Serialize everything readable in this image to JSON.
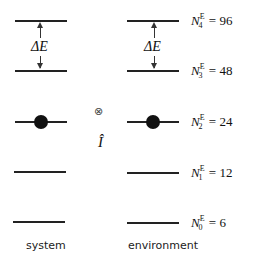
{
  "system": {
    "caption": "system",
    "delta_label": "ΔE",
    "occupied_level_index": 2
  },
  "operator": {
    "tensor_symbol": "⊗",
    "identity_symbol": "Î"
  },
  "environment": {
    "caption": "environment",
    "delta_label": "ΔE",
    "occupied_level_index": 2,
    "levels": [
      {
        "symbol": "N",
        "superscript": "E",
        "subscript": "4",
        "value": "96"
      },
      {
        "symbol": "N",
        "superscript": "E",
        "subscript": "3",
        "value": "48"
      },
      {
        "symbol": "N",
        "superscript": "E",
        "subscript": "2",
        "value": "24"
      },
      {
        "symbol": "N",
        "superscript": "E",
        "subscript": "1",
        "value": "12"
      },
      {
        "symbol": "N",
        "superscript": "E",
        "subscript": "0",
        "value": "6"
      }
    ]
  }
}
